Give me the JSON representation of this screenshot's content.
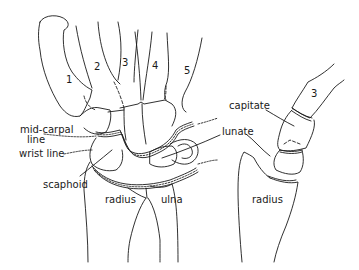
{
  "diagram": {
    "type": "anatomical-line-drawing",
    "colors": {
      "line": "#1a1a1a",
      "background": "#ffffff"
    },
    "views": [
      {
        "name": "pa-view",
        "metacarpal_numbers": [
          "1",
          "2",
          "3",
          "4",
          "5"
        ],
        "labels": {
          "mid_carpal_line": "mid-carpal line",
          "mid_carpal_line_1": "mid-carpal",
          "mid_carpal_line_2": "line",
          "wrist_line": "wrist line",
          "scaphoid": "scaphoid",
          "radius": "radius",
          "ulna": "ulna",
          "lunate": "lunate"
        }
      },
      {
        "name": "lateral-view",
        "metacarpal_numbers": [
          "3"
        ],
        "labels": {
          "capitate": "capitate",
          "radius": "radius"
        }
      }
    ]
  }
}
